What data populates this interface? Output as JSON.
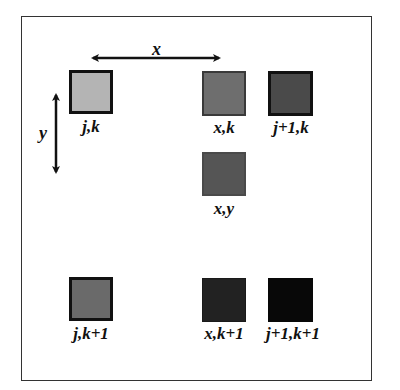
{
  "diagram": {
    "type": "bilinear-interpolation-grid",
    "axes": {
      "x": {
        "label": "x"
      },
      "y": {
        "label": "y"
      }
    },
    "cells": [
      {
        "id": "jk",
        "label": "j,k",
        "color": "#b4b4b4",
        "border": "#111111"
      },
      {
        "id": "xk",
        "label": "x,k",
        "color": "#6e6e6e",
        "border": "#3a3a3a"
      },
      {
        "id": "j1k",
        "label": "j+1,k",
        "color": "#4a4a4a",
        "border": "#111111"
      },
      {
        "id": "xy",
        "label": "x,y",
        "color": "#555555",
        "border": "#4a4a4a"
      },
      {
        "id": "jk1",
        "label": "j,k+1",
        "color": "#6a6a6a",
        "border": "#111111"
      },
      {
        "id": "xk1",
        "label": "x,k+1",
        "color": "#222222",
        "border": "#1a1a1a"
      },
      {
        "id": "j1k1",
        "label": "j+1,k+1",
        "color": "#080808",
        "border": "#080808"
      }
    ]
  }
}
